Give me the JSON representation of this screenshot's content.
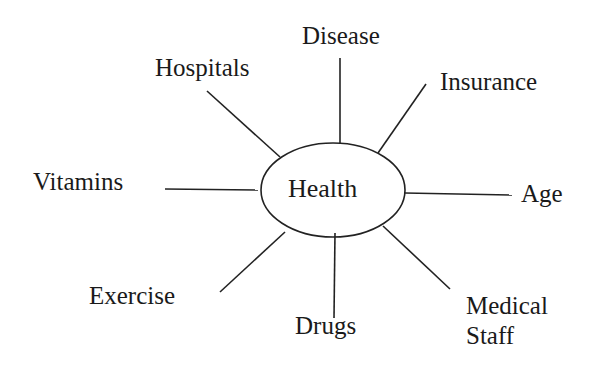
{
  "diagram": {
    "type": "mind-map",
    "center": {
      "label": "Health",
      "cx": 333,
      "cy": 190,
      "rx": 72,
      "ry": 47
    },
    "line_color": "#222222",
    "nodes": [
      {
        "id": "disease",
        "label": "Disease",
        "x1": 340,
        "y1": 58,
        "x2": 340,
        "y2": 144,
        "lx": 302,
        "ly": 22
      },
      {
        "id": "hospitals",
        "label": "Hospitals",
        "x1": 207,
        "y1": 91,
        "x2": 280,
        "y2": 157,
        "lx": 155,
        "ly": 54
      },
      {
        "id": "insurance",
        "label": "Insurance",
        "x1": 426,
        "y1": 84,
        "x2": 378,
        "y2": 153,
        "lx": 440,
        "ly": 68
      },
      {
        "id": "vitamins",
        "label": "Vitamins",
        "x1": 165,
        "y1": 189,
        "x2": 258,
        "y2": 190,
        "lx": 33,
        "ly": 168
      },
      {
        "id": "age",
        "label": "Age",
        "x1": 405,
        "y1": 193,
        "x2": 512,
        "y2": 195,
        "lx": 521,
        "ly": 180
      },
      {
        "id": "exercise",
        "label": "Exercise",
        "x1": 220,
        "y1": 292,
        "x2": 285,
        "y2": 232,
        "lx": 89,
        "ly": 282
      },
      {
        "id": "drugs",
        "label": "Drugs",
        "x1": 335,
        "y1": 233,
        "x2": 334,
        "y2": 318,
        "lx": 295,
        "ly": 312
      },
      {
        "id": "medical-staff",
        "label": "Medical",
        "label2": "Staff",
        "x1": 383,
        "y1": 226,
        "x2": 450,
        "y2": 289,
        "lx": 466,
        "ly": 292
      }
    ]
  }
}
